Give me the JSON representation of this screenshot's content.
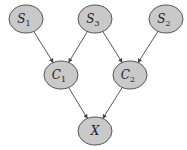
{
  "diagram": {
    "type": "directed-acyclic-graph",
    "colors": {
      "node_fill": "#c9c9c9",
      "node_stroke": "#444444",
      "edge": "#444444",
      "background": "#ffffff"
    },
    "nodes": [
      {
        "id": "S1",
        "base": "S",
        "sub": "1",
        "cx": 26,
        "cy": 19
      },
      {
        "id": "S3",
        "base": "S",
        "sub": "3",
        "cx": 95,
        "cy": 19
      },
      {
        "id": "S2",
        "base": "S",
        "sub": "2",
        "cx": 166,
        "cy": 19
      },
      {
        "id": "C1",
        "base": "C",
        "sub": "1",
        "cx": 61,
        "cy": 75
      },
      {
        "id": "C2",
        "base": "C",
        "sub": "2",
        "cx": 130,
        "cy": 75
      },
      {
        "id": "X",
        "base": "X",
        "sub": "",
        "cx": 95,
        "cy": 131
      }
    ],
    "edges": [
      {
        "from": "S1",
        "to": "C1"
      },
      {
        "from": "S3",
        "to": "C1"
      },
      {
        "from": "S3",
        "to": "C2"
      },
      {
        "from": "S2",
        "to": "C2"
      },
      {
        "from": "C1",
        "to": "X"
      },
      {
        "from": "C2",
        "to": "X"
      }
    ]
  }
}
